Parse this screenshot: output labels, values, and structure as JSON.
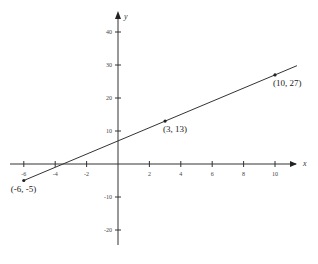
{
  "chart_data": {
    "type": "line",
    "title": "",
    "xlabel": "x",
    "ylabel": "y",
    "xlim": [
      -7,
      11.5
    ],
    "ylim": [
      -25,
      45
    ],
    "grid": false,
    "x_ticks": [
      -6,
      -4,
      -2,
      2,
      4,
      6,
      8,
      10
    ],
    "y_ticks": [
      -20,
      -10,
      10,
      20,
      30,
      40
    ],
    "x_tick_labels": [
      "-6",
      "-4",
      "-2",
      "2",
      "4",
      "6",
      "8",
      "10"
    ],
    "y_tick_labels": [
      "-20",
      "-10",
      "10",
      "20",
      "30",
      "40"
    ],
    "series": [
      {
        "name": "y = 2x + 7",
        "x": [
          -6,
          3,
          10
        ],
        "y": [
          -5,
          13,
          27
        ]
      }
    ],
    "annotations": [
      {
        "text": "(-6, -5)",
        "x": -6,
        "y": -5
      },
      {
        "text": "(3, 13)",
        "x": 3,
        "y": 13
      },
      {
        "text": "(10, 27)",
        "x": 10,
        "y": 27
      }
    ]
  }
}
